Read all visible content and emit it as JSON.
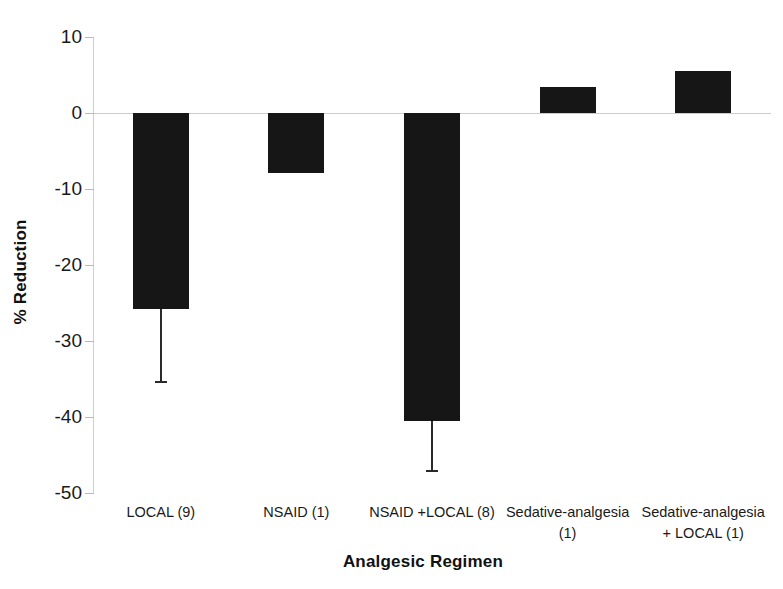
{
  "chart_data": {
    "type": "bar",
    "title": "",
    "xlabel": "Analgesic Regimen",
    "ylabel": "% Reduction",
    "categories": [
      "LOCAL (9)",
      "NSAID (1)",
      "NSAID +LOCAL (8)",
      "Sedative-analgesia (1)",
      "Sedative-analgesia + LOCAL (1)"
    ],
    "category_lines": [
      [
        "LOCAL (9)"
      ],
      [
        "NSAID (1)"
      ],
      [
        "NSAID +LOCAL (8)"
      ],
      [
        "Sedative-analgesia",
        "(1)"
      ],
      [
        "Sedative-analgesia",
        "+ LOCAL (1)"
      ]
    ],
    "values": [
      -25.8,
      -7.9,
      -40.5,
      3.4,
      5.5
    ],
    "error_low": [
      -35.2,
      null,
      -47.0,
      null,
      null
    ],
    "error_high": [
      null,
      null,
      null,
      null,
      null
    ],
    "ylim": [
      -50,
      10
    ],
    "yticks": [
      10,
      0,
      -10,
      -20,
      -30,
      -40,
      -50
    ],
    "ytick_labels": [
      "10",
      "0",
      "-10",
      "-20",
      "-30",
      "-40",
      "-50"
    ],
    "grid": false,
    "legend": "none",
    "bar_color": "#161616",
    "axis_color": "#cccccc"
  }
}
